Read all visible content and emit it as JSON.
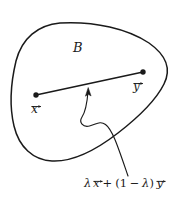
{
  "figure": {
    "type": "convex-set-diagram",
    "background_color": "#ffffff",
    "stroke_color": "#1a1a1a",
    "width": 189,
    "height": 198
  },
  "labels": {
    "set_name": "B",
    "point_x": "x",
    "point_y": "y",
    "formula_lambda": "λ",
    "formula_full": "λ x⃗ + (1 − λ) y⃗",
    "formula_parts": {
      "lambda1": "λ",
      "x": "x",
      "plus": "+",
      "open_paren": "(",
      "one": "1",
      "minus": "−",
      "lambda2": "λ",
      "close_paren": ")",
      "y": "y"
    }
  },
  "geometry": {
    "set_boundary_path": "M 60 23 C 95 21 128 29 149 43 C 166 55 172 68 164 84 C 156 100 140 116 118 133 C 96 150 72 162 52 161 C 33 160 19 147 14 126 C 9 105 11 82 16 61 C 22 38 38 25 60 23 Z",
    "segment": {
      "x1": 36,
      "y1": 95,
      "x2": 143,
      "y2": 72
    },
    "endpoint_radius": 2.6,
    "arrow_path": "M 88 91 C 87 105 86 112 82 118 C 79 123 83 127 89 126 C 96 125 100 121 105 124 C 112 128 118 146 128 176",
    "arrow_tip": {
      "x": 88,
      "y": 89
    }
  },
  "positions": {
    "set_name": {
      "left": 73,
      "top": 41
    },
    "point_x": {
      "left": 31,
      "top": 103
    },
    "point_y": {
      "left": 133,
      "top": 80
    },
    "formula": {
      "left": 84,
      "top": 178
    }
  }
}
